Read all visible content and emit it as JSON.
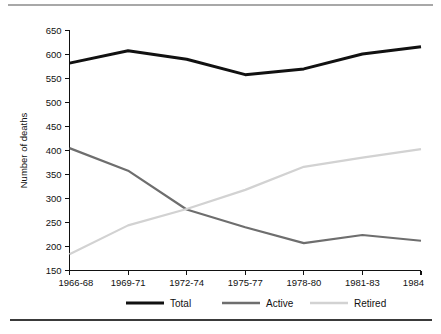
{
  "chart_data": {
    "type": "line",
    "title": "",
    "subtitle": "",
    "xlabel": "",
    "ylabel": "Number of deaths",
    "categories": [
      "1966-68",
      "1969-71",
      "1972-74",
      "1975-77",
      "1978-80",
      "1981-83",
      "1984"
    ],
    "ylim": [
      150,
      650
    ],
    "yticks": [
      150,
      200,
      250,
      300,
      350,
      400,
      450,
      500,
      550,
      600,
      650
    ],
    "ytick_labels": [
      "150",
      "200",
      "250",
      "300",
      "350",
      "400",
      "450",
      "500",
      "550",
      "600",
      "650"
    ],
    "grid": false,
    "legend_position": "bottom",
    "series": [
      {
        "name": "Total",
        "color": "#111111",
        "line_width": 3.0,
        "values": [
          582,
          608,
          590,
          558,
          570,
          601,
          616
        ]
      },
      {
        "name": "Active",
        "color": "#6e6e6e",
        "line_width": 2.2,
        "values": [
          405,
          358,
          277,
          240,
          207,
          224,
          212
        ]
      },
      {
        "name": "Retired",
        "color": "#d2d2d2",
        "line_width": 2.2,
        "values": [
          184,
          244,
          278,
          318,
          366,
          385,
          403
        ]
      }
    ],
    "annotations": []
  },
  "legend": {
    "items": [
      {
        "label": "Total",
        "color": "#111111",
        "line_width": 3.0
      },
      {
        "label": "Active",
        "color": "#6e6e6e",
        "line_width": 2.6
      },
      {
        "label": "Retired",
        "color": "#d2d2d2",
        "line_width": 2.6
      }
    ]
  },
  "rules": {
    "top_color": "#a8a8a8",
    "bottom_color": "#3a3a3a"
  }
}
